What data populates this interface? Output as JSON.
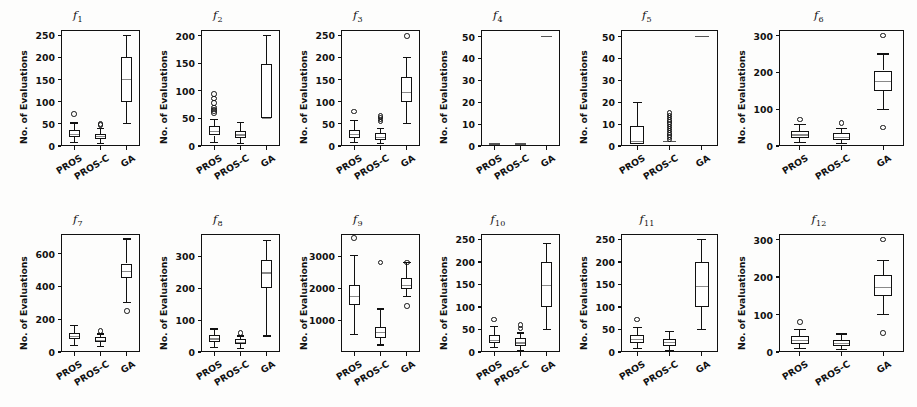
{
  "figure": {
    "ylabel": "No. of Evaluations",
    "groups": [
      "PROS",
      "PROS-C",
      "GA"
    ],
    "panel_count": 12,
    "rows": 2,
    "cols": 6
  },
  "chart_data": {
    "type": "box",
    "title": "",
    "xlabel": "",
    "ylabel": "No. of Evaluations",
    "categories": [
      "PROS",
      "PROS-C",
      "GA"
    ],
    "grid": false,
    "legend": "none",
    "panels": [
      {
        "name": "f1",
        "label": "f",
        "sub": "1",
        "ylim": [
          0,
          262
        ],
        "yticks": [
          0,
          50,
          100,
          150,
          200,
          250
        ],
        "boxes": [
          {
            "group": "PROS",
            "whisker_low": 8,
            "q1": 20,
            "median": 27,
            "q3": 37,
            "whisker_high": 52,
            "fliers": [
              72
            ]
          },
          {
            "group": "PROS-C",
            "whisker_low": 5,
            "q1": 16,
            "median": 21,
            "q3": 28,
            "whisker_high": 40,
            "fliers": [
              47,
              50
            ]
          },
          {
            "group": "GA",
            "whisker_low": 50,
            "q1": 100,
            "median": 150,
            "q3": 200,
            "whisker_high": 250,
            "fliers": []
          }
        ]
      },
      {
        "name": "f2",
        "label": "f",
        "sub": "2",
        "ylim": [
          0,
          210
        ],
        "yticks": [
          0,
          50,
          100,
          150,
          200
        ],
        "boxes": [
          {
            "group": "PROS",
            "whisker_low": 6,
            "q1": 19,
            "median": 26,
            "q3": 36,
            "whisker_high": 48,
            "fliers": [
              60,
              63,
              66,
              70,
              78,
              86,
              94
            ]
          },
          {
            "group": "PROS-C",
            "whisker_low": 4,
            "q1": 14,
            "median": 20,
            "q3": 27,
            "whisker_high": 42,
            "fliers": []
          },
          {
            "group": "GA",
            "whisker_low": 50,
            "q1": 50,
            "median": 50,
            "q3": 148,
            "whisker_high": 200,
            "fliers": []
          }
        ]
      },
      {
        "name": "f3",
        "label": "f",
        "sub": "3",
        "ylim": [
          0,
          262
        ],
        "yticks": [
          0,
          50,
          100,
          150,
          200,
          250
        ],
        "boxes": [
          {
            "group": "PROS",
            "whisker_low": 7,
            "q1": 19,
            "median": 26,
            "q3": 36,
            "whisker_high": 57,
            "fliers": [
              78
            ]
          },
          {
            "group": "PROS-C",
            "whisker_low": 5,
            "q1": 14,
            "median": 20,
            "q3": 29,
            "whisker_high": 40,
            "fliers": [
              55,
              60,
              64,
              68
            ]
          },
          {
            "group": "GA",
            "whisker_low": 50,
            "q1": 100,
            "median": 120,
            "q3": 155,
            "whisker_high": 200,
            "fliers": [
              248
            ]
          }
        ]
      },
      {
        "name": "f4",
        "label": "f",
        "sub": "4",
        "ylim": [
          0,
          53
        ],
        "yticks": [
          0,
          10,
          20,
          30,
          40,
          50
        ],
        "boxes": [
          {
            "group": "PROS",
            "whisker_low": 1,
            "q1": 1,
            "median": 1,
            "q3": 1,
            "whisker_high": 1,
            "fliers": [],
            "flat": true
          },
          {
            "group": "PROS-C",
            "whisker_low": 1,
            "q1": 1,
            "median": 1,
            "q3": 1,
            "whisker_high": 1,
            "fliers": [],
            "flat": true
          },
          {
            "group": "GA",
            "whisker_low": 50,
            "q1": 50,
            "median": 50,
            "q3": 50,
            "whisker_high": 50,
            "fliers": [],
            "flat": true
          }
        ]
      },
      {
        "name": "f5",
        "label": "f",
        "sub": "5",
        "ylim": [
          0,
          53
        ],
        "yticks": [
          0,
          10,
          20,
          30,
          40,
          50
        ],
        "boxes": [
          {
            "group": "PROS",
            "whisker_low": 1,
            "q1": 1,
            "median": 2,
            "q3": 9,
            "whisker_high": 20,
            "fliers": []
          },
          {
            "group": "PROS-C",
            "whisker_low": 2,
            "q1": 2,
            "median": 2,
            "q3": 2,
            "whisker_high": 2,
            "fliers": [
              3,
              4,
              5,
              6,
              7,
              8,
              9,
              10,
              11,
              12,
              13,
              14,
              15
            ]
          },
          {
            "group": "GA",
            "whisker_low": 50,
            "q1": 50,
            "median": 50,
            "q3": 50,
            "whisker_high": 50,
            "fliers": [],
            "flat": true
          }
        ]
      },
      {
        "name": "f6",
        "label": "f",
        "sub": "6",
        "ylim": [
          0,
          315
        ],
        "yticks": [
          0,
          100,
          200,
          300
        ],
        "boxes": [
          {
            "group": "PROS",
            "whisker_low": 9,
            "q1": 22,
            "median": 30,
            "q3": 42,
            "whisker_high": 58,
            "fliers": [
              72
            ]
          },
          {
            "group": "PROS-C",
            "whisker_low": 6,
            "q1": 16,
            "median": 23,
            "q3": 34,
            "whisker_high": 48,
            "fliers": [
              62
            ]
          },
          {
            "group": "GA",
            "whisker_low": 100,
            "q1": 150,
            "median": 175,
            "q3": 205,
            "whisker_high": 250,
            "fliers": [
              50,
              300
            ]
          }
        ]
      },
      {
        "name": "f7",
        "label": "f",
        "sub": "7",
        "ylim": [
          0,
          720
        ],
        "yticks": [
          0,
          200,
          400,
          600
        ],
        "boxes": [
          {
            "group": "PROS",
            "whisker_low": 40,
            "q1": 78,
            "median": 95,
            "q3": 118,
            "whisker_high": 160,
            "fliers": []
          },
          {
            "group": "PROS-C",
            "whisker_low": 32,
            "q1": 60,
            "median": 72,
            "q3": 92,
            "whisker_high": 110,
            "fliers": [
              128
            ]
          },
          {
            "group": "GA",
            "whisker_low": 300,
            "q1": 450,
            "median": 490,
            "q3": 540,
            "whisker_high": 690,
            "fliers": [
              250
            ]
          }
        ]
      },
      {
        "name": "f8",
        "label": "f",
        "sub": "8",
        "ylim": [
          0,
          370
        ],
        "yticks": [
          0,
          100,
          200,
          300
        ],
        "boxes": [
          {
            "group": "PROS",
            "whisker_low": 15,
            "q1": 30,
            "median": 41,
            "q3": 52,
            "whisker_high": 72,
            "fliers": []
          },
          {
            "group": "PROS-C",
            "whisker_low": 10,
            "q1": 24,
            "median": 30,
            "q3": 40,
            "whisker_high": 50,
            "fliers": [
              60
            ]
          },
          {
            "group": "GA",
            "whisker_low": 50,
            "q1": 200,
            "median": 248,
            "q3": 288,
            "whisker_high": 350,
            "fliers": []
          }
        ]
      },
      {
        "name": "f9",
        "label": "f",
        "sub": "9",
        "ylim": [
          0,
          3700
        ],
        "yticks": [
          1000,
          2000,
          3000
        ],
        "boxes": [
          {
            "group": "PROS",
            "whisker_low": 540,
            "q1": 1480,
            "median": 1750,
            "q3": 2110,
            "whisker_high": 3030,
            "fliers": [
              3580
            ]
          },
          {
            "group": "PROS-C",
            "whisker_low": 220,
            "q1": 440,
            "median": 600,
            "q3": 790,
            "whisker_high": 1350,
            "fliers": [
              2800
            ]
          },
          {
            "group": "GA",
            "whisker_low": 1750,
            "q1": 1980,
            "median": 2090,
            "q3": 2330,
            "whisker_high": 2800,
            "fliers": [
              1450,
              2800
            ]
          }
        ]
      },
      {
        "name": "f10",
        "label": "f",
        "sub": "10",
        "ylim": [
          0,
          262
        ],
        "yticks": [
          0,
          50,
          100,
          150,
          200,
          250
        ],
        "boxes": [
          {
            "group": "PROS",
            "whisker_low": 10,
            "q1": 20,
            "median": 26,
            "q3": 38,
            "whisker_high": 56,
            "fliers": [
              72
            ]
          },
          {
            "group": "PROS-C",
            "whisker_low": 4,
            "q1": 14,
            "median": 20,
            "q3": 30,
            "whisker_high": 42,
            "fliers": [
              52,
              60
            ]
          },
          {
            "group": "GA",
            "whisker_low": 50,
            "q1": 100,
            "median": 147,
            "q3": 200,
            "whisker_high": 240,
            "fliers": []
          }
        ]
      },
      {
        "name": "f11",
        "label": "f",
        "sub": "11",
        "ylim": [
          0,
          262
        ],
        "yticks": [
          0,
          50,
          100,
          150,
          200,
          250
        ],
        "boxes": [
          {
            "group": "PROS",
            "whisker_low": 8,
            "q1": 20,
            "median": 27,
            "q3": 38,
            "whisker_high": 55,
            "fliers": [
              72
            ]
          },
          {
            "group": "PROS-C",
            "whisker_low": 4,
            "q1": 14,
            "median": 21,
            "q3": 29,
            "whisker_high": 45,
            "fliers": []
          },
          {
            "group": "GA",
            "whisker_low": 50,
            "q1": 100,
            "median": 145,
            "q3": 200,
            "whisker_high": 250,
            "fliers": []
          }
        ]
      },
      {
        "name": "f12",
        "label": "f",
        "sub": "12",
        "ylim": [
          0,
          315
        ],
        "yticks": [
          0,
          100,
          200,
          300
        ],
        "boxes": [
          {
            "group": "PROS",
            "whisker_low": 10,
            "q1": 22,
            "median": 30,
            "q3": 42,
            "whisker_high": 60,
            "fliers": [
              80
            ]
          },
          {
            "group": "PROS-C",
            "whisker_low": 6,
            "q1": 16,
            "median": 23,
            "q3": 33,
            "whisker_high": 48,
            "fliers": []
          },
          {
            "group": "GA",
            "whisker_low": 100,
            "q1": 150,
            "median": 172,
            "q3": 205,
            "whisker_high": 245,
            "fliers": [
              50,
              300
            ]
          }
        ]
      }
    ]
  }
}
